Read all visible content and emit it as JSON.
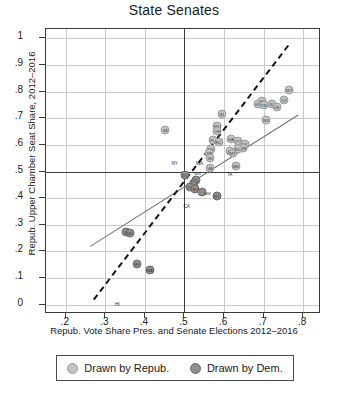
{
  "chart_data": {
    "type": "scatter",
    "title": "State Senates",
    "xlabel": "Repub. Vote Share Pres. and Senate Elections 2012–2016",
    "ylabel": "Repub. Upper Chamber Seat Share, 2012–2016",
    "xlim": [
      0.15,
      0.845
    ],
    "ylim": [
      -0.035,
      1.035
    ],
    "xticks": [
      ".2",
      ".3",
      ".4",
      ".5",
      ".6",
      ".7",
      ".8"
    ],
    "xtick_values": [
      0.2,
      0.3,
      0.4,
      0.5,
      0.6,
      0.7,
      0.8
    ],
    "yticks": [
      "0",
      ".1",
      ".2",
      ".3",
      ".4",
      ".5",
      ".6",
      ".7",
      ".8",
      ".9",
      "1"
    ],
    "ytick_values": [
      0,
      0.1,
      0.2,
      0.3,
      0.4,
      0.5,
      0.6,
      0.7,
      0.8,
      0.9,
      1.0
    ],
    "grid": true,
    "reference_lines": {
      "x": 0.5,
      "y": 0.5
    },
    "legend_position": "below",
    "series": [
      {
        "name": "Drawn by Repub.",
        "color": "#c3c3c3",
        "points": [
          {
            "label": "MI",
            "x": 0.452,
            "y": 0.655
          },
          {
            "label": "IN",
            "x": 0.594,
            "y": 0.715
          },
          {
            "label": "MO",
            "x": 0.583,
            "y": 0.672
          },
          {
            "label": "OH",
            "x": 0.583,
            "y": 0.651
          },
          {
            "label": "FL",
            "x": 0.571,
            "y": 0.617
          },
          {
            "label": "NC",
            "x": 0.586,
            "y": 0.612
          },
          {
            "label": "GA",
            "x": 0.617,
            "y": 0.623
          },
          {
            "label": "NH",
            "x": 0.566,
            "y": 0.585
          },
          {
            "label": "PA",
            "x": 0.563,
            "y": 0.57
          },
          {
            "label": "WI",
            "x": 0.565,
            "y": 0.551
          },
          {
            "label": "KS",
            "x": 0.686,
            "y": 0.752
          },
          {
            "label": "SD",
            "x": 0.697,
            "y": 0.766
          },
          {
            "label": "TN",
            "x": 0.7,
            "y": 0.748
          },
          {
            "label": "ID",
            "x": 0.721,
            "y": 0.753
          },
          {
            "label": "OK",
            "x": 0.733,
            "y": 0.742
          },
          {
            "label": "UT",
            "x": 0.752,
            "y": 0.767
          },
          {
            "label": "WY",
            "x": 0.765,
            "y": 0.805
          },
          {
            "label": "ND",
            "x": 0.707,
            "y": 0.692
          },
          {
            "label": "KY",
            "x": 0.636,
            "y": 0.614
          },
          {
            "label": "LA",
            "x": 0.639,
            "y": 0.6
          },
          {
            "label": "AK",
            "x": 0.652,
            "y": 0.603
          },
          {
            "label": "TX",
            "x": 0.646,
            "y": 0.592
          },
          {
            "label": "MS",
            "x": 0.649,
            "y": 0.589
          },
          {
            "label": "AZ",
            "x": 0.616,
            "y": 0.578
          },
          {
            "label": "MT",
            "x": 0.622,
            "y": 0.57
          },
          {
            "label": "SD2",
            "x": 0.634,
            "y": 0.583
          },
          {
            "label": "ME",
            "x": 0.63,
            "y": 0.522
          },
          {
            "label": "VA",
            "x": 0.564,
            "y": 0.513
          },
          {
            "label": "IA",
            "x": 0.59,
            "y": 0.498
          },
          {
            "label": "WA",
            "x": 0.538,
            "y": 0.497
          },
          {
            "label": "NY",
            "x": 0.475,
            "y": 0.497
          }
        ]
      },
      {
        "name": "Drawn by Dem.",
        "color": "#8e8e8e",
        "points": [
          {
            "label": "MN",
            "x": 0.528,
            "y": 0.468
          },
          {
            "label": "OR",
            "x": 0.524,
            "y": 0.455
          },
          {
            "label": "CT",
            "x": 0.521,
            "y": 0.449
          },
          {
            "label": "CO",
            "x": 0.515,
            "y": 0.441
          },
          {
            "label": "NJ",
            "x": 0.527,
            "y": 0.436
          },
          {
            "label": "NM",
            "x": 0.543,
            "y": 0.424
          },
          {
            "label": "CA",
            "x": 0.536,
            "y": 0.387
          },
          {
            "label": "IL",
            "x": 0.352,
            "y": 0.271
          },
          {
            "label": "MD",
            "x": 0.362,
            "y": 0.268
          },
          {
            "label": "RI",
            "x": 0.38,
            "y": 0.153
          },
          {
            "label": "MA",
            "x": 0.412,
            "y": 0.131
          },
          {
            "label": "NV",
            "x": 0.581,
            "y": 0.407
          },
          {
            "label": "DC",
            "x": 0.502,
            "y": 0.485
          },
          {
            "label": "HI",
            "x": 0.33,
            "y": 0.035
          }
        ]
      }
    ],
    "fit_lines": [
      {
        "name": "solid-fit",
        "style": "solid",
        "x1": 0.262,
        "y1": 0.222,
        "x2": 0.787,
        "y2": 0.715
      },
      {
        "name": "dashed-fit",
        "style": "dashed",
        "x1": 0.268,
        "y1": 0.02,
        "x2": 0.76,
        "y2": 0.975
      }
    ]
  },
  "legend": {
    "items": [
      {
        "label": "Drawn by Repub.",
        "color": "#c3c3c3"
      },
      {
        "label": "Drawn by Dem.",
        "color": "#8e8e8e"
      }
    ]
  },
  "caption": ""
}
